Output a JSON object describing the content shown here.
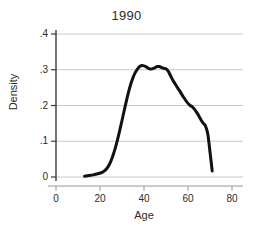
{
  "chart_data": {
    "type": "line",
    "title": "1990",
    "xlabel": "Age",
    "ylabel": "Density",
    "xlim": [
      -8,
      84
    ],
    "ylim": [
      0,
      0.4
    ],
    "xticks": [
      0,
      20,
      40,
      60,
      80
    ],
    "xtick_labels": [
      "0",
      "20",
      "40",
      "60",
      "80"
    ],
    "yticks": [
      0,
      0.1,
      0.2,
      0.3,
      0.4
    ],
    "ytick_labels": [
      "0",
      ".1",
      ".2",
      ".3",
      ".4"
    ],
    "grid": "horizontal",
    "legend": "none",
    "series": [
      {
        "name": "Density",
        "color": "#111111",
        "linewidth": 3,
        "x": [
          13,
          15,
          17,
          19,
          21,
          22,
          23,
          24,
          25,
          26,
          27,
          28,
          29,
          30,
          31,
          32,
          33,
          34,
          35,
          36,
          37,
          38,
          39,
          40,
          41,
          42,
          43,
          44,
          45,
          46,
          47,
          48,
          49,
          50,
          51,
          52,
          53,
          54,
          55,
          56,
          57,
          58,
          59,
          60,
          61,
          62,
          63,
          64,
          65,
          66,
          67,
          68,
          69,
          70,
          71
        ],
        "y": [
          0.002,
          0.004,
          0.006,
          0.009,
          0.013,
          0.017,
          0.023,
          0.032,
          0.045,
          0.062,
          0.082,
          0.105,
          0.131,
          0.158,
          0.186,
          0.213,
          0.238,
          0.26,
          0.278,
          0.292,
          0.302,
          0.309,
          0.312,
          0.311,
          0.308,
          0.304,
          0.302,
          0.303,
          0.306,
          0.309,
          0.309,
          0.306,
          0.304,
          0.303,
          0.296,
          0.284,
          0.272,
          0.262,
          0.252,
          0.243,
          0.233,
          0.223,
          0.214,
          0.206,
          0.2,
          0.196,
          0.189,
          0.18,
          0.17,
          0.159,
          0.15,
          0.142,
          0.12,
          0.07,
          0.017
        ]
      }
    ]
  },
  "axes": {
    "ytick_positions_px": [
      177,
      141,
      105,
      70,
      34
    ],
    "xtick_positions_px": [
      56,
      100,
      144,
      188,
      232
    ]
  }
}
